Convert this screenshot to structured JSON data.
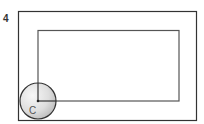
{
  "problem_number": "4",
  "circle_label": "C",
  "colors": {
    "stroke": "#333333",
    "inner_stroke": "#555555",
    "circle_fill_light": "#f4f4f4",
    "circle_fill_dark": "#bdbdbd"
  }
}
